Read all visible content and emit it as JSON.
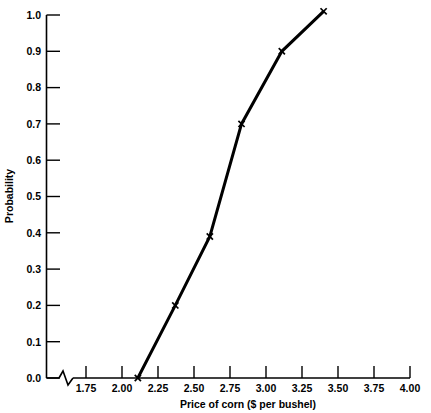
{
  "chart_data": {
    "type": "line",
    "title": "",
    "xlabel": "Price of corn ($ per bushel)",
    "ylabel": "Probability",
    "xlim": [
      1.6,
      4.0
    ],
    "ylim": [
      0.0,
      1.0
    ],
    "grid": false,
    "legend": null,
    "axis_break": "x-axis broken between origin and 1.75",
    "marker": "x",
    "line_color": "#000000",
    "x": [
      2.11,
      2.37,
      2.61,
      2.83,
      3.11,
      3.4
    ],
    "y": [
      0.0,
      0.2,
      0.39,
      0.7,
      0.9,
      1.01
    ],
    "series": [
      {
        "name": "Cumulative probability",
        "points": [
          {
            "x": 2.11,
            "y": 0.0
          },
          {
            "x": 2.37,
            "y": 0.2
          },
          {
            "x": 2.61,
            "y": 0.39
          },
          {
            "x": 2.83,
            "y": 0.7
          },
          {
            "x": 3.11,
            "y": 0.9
          },
          {
            "x": 3.4,
            "y": 1.01
          }
        ]
      }
    ],
    "xticks": [
      1.75,
      2.0,
      2.25,
      2.5,
      2.75,
      3.0,
      3.25,
      3.5,
      3.75,
      4.0
    ],
    "xticklabels": [
      "1.75",
      "2.00",
      "2.25",
      "2.50",
      "2.75",
      "3.00",
      "3.25",
      "3.50",
      "3.75",
      "4.00"
    ],
    "yticks": [
      0.0,
      0.1,
      0.2,
      0.3,
      0.4,
      0.5,
      0.6,
      0.7,
      0.8,
      0.9,
      1.0
    ],
    "yticklabels": [
      "0.0",
      "0.1",
      "0.2",
      "0.3",
      "0.4",
      "0.5",
      "0.6",
      "0.7",
      "0.8",
      "0.9",
      "1.0"
    ]
  },
  "axes": {
    "x_title": "Price of corn ($ per bushel)",
    "y_title": "Probability"
  },
  "xtick_labels": {
    "0": "1.75",
    "1": "2.00",
    "2": "2.25",
    "3": "2.50",
    "4": "2.75",
    "5": "3.00",
    "6": "3.25",
    "7": "3.50",
    "8": "3.75",
    "9": "4.00"
  },
  "ytick_labels": {
    "0": "0.0",
    "1": "0.1",
    "2": "0.2",
    "3": "0.3",
    "4": "0.4",
    "5": "0.5",
    "6": "0.6",
    "7": "0.7",
    "8": "0.8",
    "9": "0.9",
    "10": "1.0"
  }
}
